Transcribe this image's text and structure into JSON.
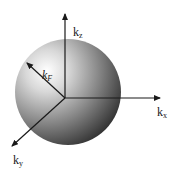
{
  "figure": {
    "colors": {
      "sphere_highlight": "#ffffff",
      "sphere_mid": "#9a9a9a",
      "sphere_dark": "#3a3a3a",
      "axis": "#1a1a1a"
    },
    "axes": [
      {
        "id": "kz",
        "base": "k",
        "sub": "z"
      },
      {
        "id": "kx",
        "base": "k",
        "sub": "x"
      },
      {
        "id": "ky",
        "base": "k",
        "sub": "y"
      }
    ],
    "radius_label": {
      "base": "k",
      "sub": "F"
    }
  }
}
